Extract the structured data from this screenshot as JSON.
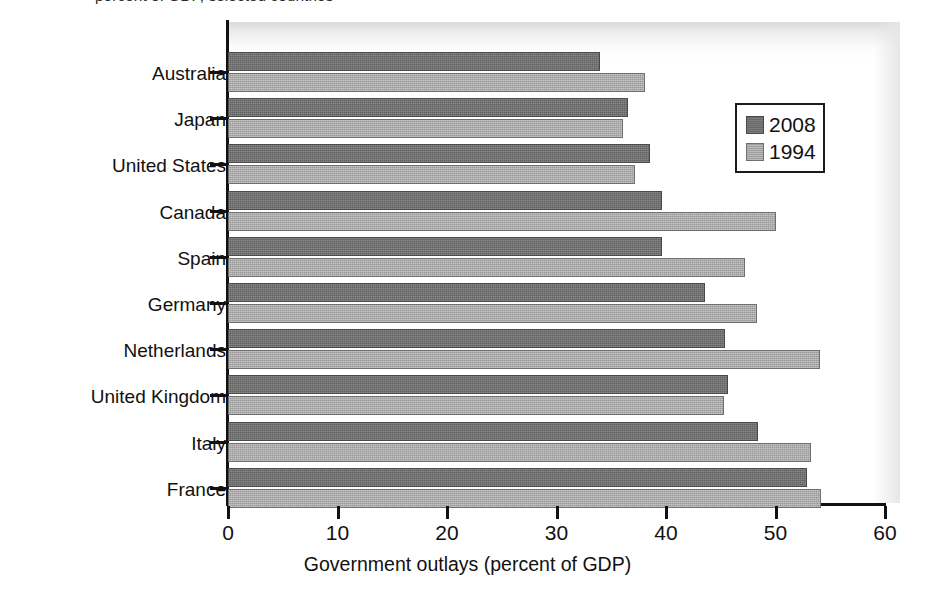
{
  "figure": {
    "clipped_caption": "percent of GDP, selected countries",
    "x_axis_title": "Government outlays (percent of GDP)"
  },
  "legend": {
    "entries": [
      {
        "label": "2008",
        "color": "#6e6e6e"
      },
      {
        "label": "1994",
        "color": "#a9a9a9"
      }
    ]
  },
  "chart_data": {
    "type": "bar",
    "orientation": "horizontal",
    "title": "",
    "xlabel": "Government outlays (percent of GDP)",
    "ylabel": "",
    "xlim": [
      0,
      60
    ],
    "xticks": [
      0,
      10,
      20,
      30,
      40,
      50,
      60
    ],
    "xtick_labels": [
      "0",
      "10",
      "20",
      "30",
      "40",
      "50",
      "60"
    ],
    "grid": false,
    "legend_position": "upper right (inside axes)",
    "categories": [
      "Australia",
      "Japan",
      "United States",
      "Canada",
      "Spain",
      "Germany",
      "Netherlands",
      "United Kingdom",
      "Italy",
      "France"
    ],
    "series": [
      {
        "name": "2008",
        "color": "#6e6e6e",
        "values": [
          34.0,
          36.5,
          38.5,
          39.6,
          39.6,
          43.6,
          45.4,
          45.7,
          48.4,
          52.9
        ]
      },
      {
        "name": "1994",
        "color": "#a9a9a9",
        "values": [
          38.1,
          36.1,
          37.2,
          50.0,
          47.2,
          48.3,
          54.1,
          45.3,
          53.2,
          54.2
        ]
      }
    ]
  }
}
